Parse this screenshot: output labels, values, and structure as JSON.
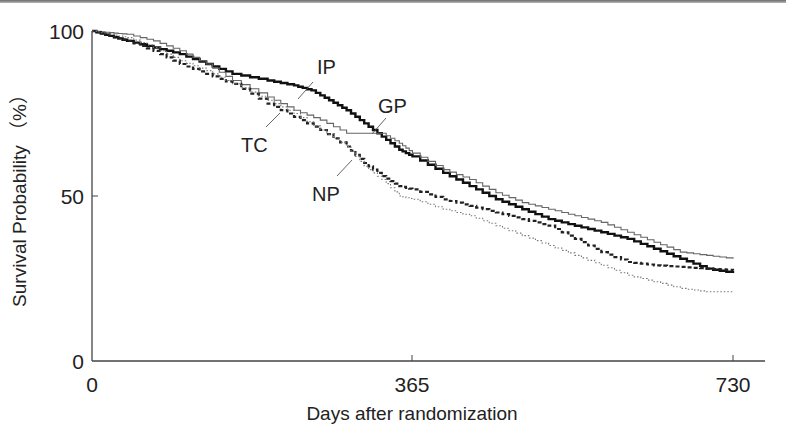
{
  "chart_data": {
    "type": "line",
    "subtype": "kaplan-meier-step",
    "title": "",
    "xlabel": "Days after randomization",
    "ylabel": "Survival Probability （%）",
    "xlim": [
      0,
      730
    ],
    "ylim": [
      0,
      100
    ],
    "x_ticks": [
      0,
      365,
      730
    ],
    "y_ticks": [
      0,
      50,
      100
    ],
    "grid": false,
    "legend": "inline labels with leader lines",
    "series": [
      {
        "name": "IP",
        "style": "thick solid",
        "x": [
          0,
          20,
          40,
          70,
          100,
          130,
          160,
          200,
          230,
          250,
          270,
          290,
          310,
          330,
          350,
          365,
          400,
          430,
          460,
          490,
          520,
          550,
          580,
          610,
          640,
          670,
          700,
          730
        ],
        "y": [
          100,
          98.5,
          97,
          95,
          93,
          90,
          87,
          85,
          83.5,
          82,
          79,
          76,
          72,
          68,
          64,
          62,
          57,
          53,
          49,
          46,
          43,
          41,
          39,
          37,
          34,
          31,
          28,
          26.7
        ]
      },
      {
        "name": "GP",
        "style": "thin solid gray",
        "x": [
          0,
          20,
          40,
          70,
          100,
          130,
          160,
          200,
          230,
          260,
          290,
          310,
          330,
          350,
          365,
          400,
          430,
          460,
          490,
          520,
          550,
          580,
          610,
          640,
          670,
          700,
          730
        ],
        "y": [
          100,
          99.5,
          99,
          97,
          94,
          90,
          85,
          80,
          76,
          73,
          69,
          69,
          69,
          66,
          63,
          58,
          55,
          51,
          48,
          46,
          44,
          42,
          39,
          36,
          33,
          32,
          31
        ]
      },
      {
        "name": "TC",
        "style": "bold dashed",
        "x": [
          0,
          20,
          40,
          70,
          100,
          130,
          160,
          200,
          230,
          260,
          290,
          310,
          330,
          350,
          365,
          400,
          430,
          460,
          490,
          520,
          550,
          580,
          610,
          640,
          670,
          700,
          730
        ],
        "y": [
          100,
          98.5,
          97,
          94,
          90,
          87,
          84,
          78,
          74,
          70,
          65,
          60,
          56,
          53,
          52,
          49,
          47,
          45,
          43,
          41,
          37,
          33,
          30,
          29,
          28.5,
          28,
          27.5
        ]
      },
      {
        "name": "NP",
        "style": "thin dotted",
        "x": [
          0,
          20,
          40,
          70,
          100,
          130,
          160,
          200,
          230,
          260,
          290,
          310,
          330,
          350,
          365,
          400,
          430,
          460,
          490,
          520,
          550,
          580,
          610,
          640,
          670,
          700,
          730
        ],
        "y": [
          100,
          99,
          98,
          95,
          91,
          88,
          84,
          79,
          75,
          70,
          65,
          59,
          55,
          50,
          49,
          46,
          44,
          41,
          38,
          35,
          32,
          29,
          26,
          24,
          22,
          21,
          21
        ]
      }
    ],
    "annotations": [
      {
        "text": "IP",
        "x": 248,
        "y": 84
      },
      {
        "text": "GP",
        "x": 330,
        "y": 70
      },
      {
        "text": "TC",
        "x": 170,
        "y": 68
      },
      {
        "text": "NP",
        "x": 260,
        "y": 50
      }
    ]
  },
  "axes": {
    "y_tick_labels": [
      "100",
      "50",
      "0"
    ],
    "x_tick_labels": [
      "0",
      "365",
      "730"
    ],
    "xlabel": "Days after randomization",
    "ylabel": "Survival Probability （%）"
  },
  "labels": {
    "ip": "IP",
    "gp": "GP",
    "tc": "TC",
    "np": "NP"
  }
}
